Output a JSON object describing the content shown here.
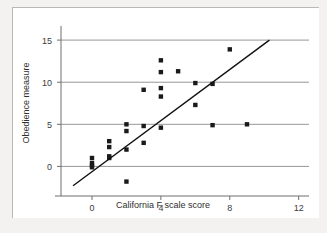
{
  "figure": {
    "background_color": "#f3f2f1",
    "plot_background_color": "#ffffff",
    "point_color": "#1a1a1a",
    "line_color": "#111111",
    "grid_color": "#8a8a8a"
  },
  "chart_data": {
    "type": "scatter",
    "title": "",
    "xlabel": "California F scale score",
    "ylabel": "Obedience measure",
    "xlim": [
      -1.8,
      12.6
    ],
    "ylim": [
      -2.8,
      16.2
    ],
    "xticks": [
      0,
      4,
      8,
      12
    ],
    "xtick_labels": [
      "0",
      "4",
      "8",
      "12"
    ],
    "yticks": [
      0,
      5,
      10,
      15
    ],
    "ytick_labels": [
      "0",
      "5",
      "10",
      "15"
    ],
    "grid": "horizontal",
    "legend": "none",
    "points": [
      {
        "x": 0,
        "y": 1.0
      },
      {
        "x": 0,
        "y": 0.4
      },
      {
        "x": 0,
        "y": 0.1
      },
      {
        "x": 0,
        "y": -0.1
      },
      {
        "x": 1,
        "y": 3.0
      },
      {
        "x": 1,
        "y": 2.3
      },
      {
        "x": 1,
        "y": 1.2
      },
      {
        "x": 1,
        "y": 1.0
      },
      {
        "x": 2,
        "y": 5.0
      },
      {
        "x": 2,
        "y": 4.2
      },
      {
        "x": 2,
        "y": 2.0
      },
      {
        "x": 2,
        "y": -1.8
      },
      {
        "x": 3,
        "y": 9.1
      },
      {
        "x": 3,
        "y": 4.8
      },
      {
        "x": 3,
        "y": 2.8
      },
      {
        "x": 4,
        "y": 12.6
      },
      {
        "x": 4,
        "y": 11.2
      },
      {
        "x": 4,
        "y": 9.3
      },
      {
        "x": 4,
        "y": 8.3
      },
      {
        "x": 4,
        "y": 4.6
      },
      {
        "x": 5,
        "y": 11.3
      },
      {
        "x": 6,
        "y": 9.9
      },
      {
        "x": 6,
        "y": 7.3
      },
      {
        "x": 7,
        "y": 9.8
      },
      {
        "x": 7,
        "y": 4.9
      },
      {
        "x": 8,
        "y": 13.9
      },
      {
        "x": 9,
        "y": 5.0
      }
    ],
    "regression_line": {
      "x_start": -1.1,
      "y_start": -2.3,
      "x_end": 10.3,
      "y_end": 15.0
    }
  }
}
